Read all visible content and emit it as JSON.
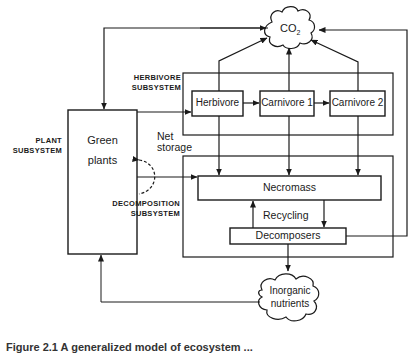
{
  "diagram": {
    "clouds": {
      "co2": "CO",
      "co2_sub": "2",
      "inorganic_line1": "Inorganic",
      "inorganic_line2": "nutrients"
    },
    "subsystem_labels": {
      "herbivore_line1": "HERBIVORE",
      "herbivore_line2": "SUBSYSTEM",
      "plant_line1": "PLANT",
      "plant_line2": "SUBSYSTEM",
      "decomposition_line1": "DECOMPOSITION",
      "decomposition_line2": "SUBSYSTEM"
    },
    "nodes": {
      "green_plants_line1": "Green",
      "green_plants_line2": "plants",
      "herbivore": "Herbivore",
      "carnivore1": "Carnivore 1",
      "carnivore2": "Carnivore 2",
      "necromass": "Necromass",
      "decomposers": "Decomposers"
    },
    "edge_labels": {
      "net_storage_line1": "Net",
      "net_storage_line2": "storage",
      "recycling": "Recycling"
    },
    "caption": "Figure 2.1  A generalized model of ecosystem ..."
  }
}
